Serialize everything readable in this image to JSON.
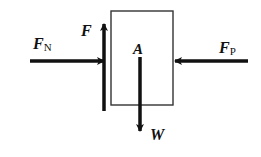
{
  "diagram": {
    "type": "free-body diagram",
    "body": {
      "label": "A",
      "shape": "rectangle"
    },
    "forces": [
      {
        "id": "FN",
        "symbol": "F",
        "subscript": "N",
        "direction": "right",
        "description": "normal force pushing block from left"
      },
      {
        "id": "F",
        "symbol": "F",
        "subscript": "",
        "direction": "up",
        "description": "friction force along left face"
      },
      {
        "id": "FP",
        "symbol": "F",
        "subscript": "P",
        "direction": "left",
        "description": "applied force pushing block from right"
      },
      {
        "id": "W",
        "symbol": "W",
        "subscript": "",
        "direction": "down",
        "description": "weight of block"
      }
    ],
    "colors": {
      "stroke": "#111111",
      "background": "#ffffff"
    }
  }
}
